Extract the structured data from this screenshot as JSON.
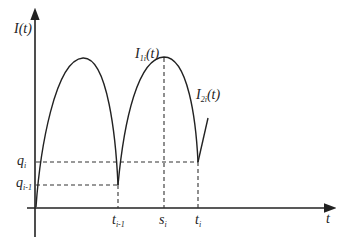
{
  "diagram": {
    "y_axis_label": {
      "base": "I",
      "arg": "(t)"
    },
    "x_axis_label": "t",
    "curve_labels": [
      {
        "base": "I",
        "sub": "1i",
        "arg": "(t)"
      },
      {
        "base": "I",
        "sub": "2i",
        "arg": "(t)"
      }
    ],
    "y_ticks": [
      {
        "base": "q",
        "sub": "i"
      },
      {
        "base": "q",
        "sub": "i-1"
      }
    ],
    "x_ticks": [
      {
        "base": "t",
        "sub": "i-1"
      },
      {
        "base": "s",
        "sub": "i"
      },
      {
        "base": "t",
        "sub": "i"
      }
    ],
    "colors": {
      "line": "#222222",
      "background": "#ffffff"
    }
  }
}
